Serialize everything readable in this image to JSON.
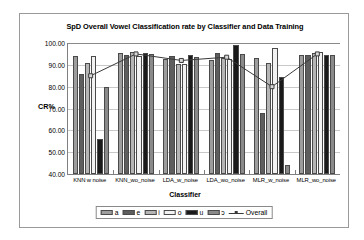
{
  "chart_data": {
    "type": "bar",
    "title": "SpD Overall Vowel Classification rate by Classifier and Data Training",
    "xlabel": "Classifier",
    "ylabel": "CR%",
    "ylim": [
      40.0,
      100.0
    ],
    "ytick_step": 10.0,
    "ytick_labels": [
      "100.00",
      "90.00",
      "80.00",
      "70.00",
      "60.00",
      "50.00",
      "40.00"
    ],
    "ytick_values": [
      100.0,
      90.0,
      80.0,
      70.0,
      60.0,
      50.0,
      40.0
    ],
    "grid": true,
    "legend_position": "bottom",
    "categories": [
      "KNN w noise",
      "KNN_wo_noise",
      "LDA_w_noise",
      "LDA_wo_noise",
      "MLR_w_noise",
      "MLR_wo_noise"
    ],
    "series": [
      {
        "name": "a",
        "type": "bar",
        "color": "#9d9d9d",
        "values": [
          94.0,
          95.5,
          92.5,
          92.0,
          93.0,
          94.5
        ]
      },
      {
        "name": "e",
        "type": "bar",
        "color": "#5e5e5e",
        "values": [
          86.0,
          94.5,
          94.0,
          95.5,
          68.0,
          94.5
        ]
      },
      {
        "name": "i",
        "type": "bar",
        "color": "#b5b5b5",
        "values": [
          91.0,
          96.0,
          90.5,
          93.0,
          91.0,
          95.5
        ]
      },
      {
        "name": "o",
        "type": "bar",
        "color": "#f2f2f2",
        "values": [
          94.0,
          94.0,
          90.5,
          92.5,
          97.5,
          96.0
        ]
      },
      {
        "name": "u",
        "type": "bar",
        "color": "#1a1a1a",
        "values": [
          56.0,
          95.5,
          94.5,
          99.0,
          84.5,
          94.5
        ]
      },
      {
        "name": "ɔ",
        "type": "bar",
        "color": "#8a8a8a",
        "values": [
          80.0,
          95.0,
          93.5,
          95.0,
          44.0,
          94.5
        ]
      },
      {
        "name": "Overall",
        "type": "line",
        "color": "#3a3a3a",
        "values": [
          85.0,
          95.0,
          92.0,
          93.5,
          80.0,
          95.0
        ]
      }
    ]
  },
  "legend": {
    "items": [
      {
        "label": "a"
      },
      {
        "label": "e"
      },
      {
        "label": "i"
      },
      {
        "label": "o"
      },
      {
        "label": "u"
      },
      {
        "label": "ɔ"
      },
      {
        "label": "Overall"
      }
    ]
  }
}
